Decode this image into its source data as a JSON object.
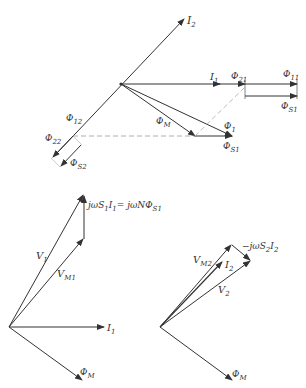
{
  "colors": {
    "line": "#333333",
    "dashed": "#999999",
    "background": "#ffffff"
  },
  "top_diagram": {
    "labels": {
      "I2": "I",
      "I2_sub": "2",
      "I1": "I",
      "I1_sub": "1",
      "phi21": "Φ",
      "phi21_sub": "21",
      "phi11": "Φ",
      "phi11_sub": "11",
      "phiS1_right": "Φ",
      "phiS1_right_sub": "S1",
      "phiM": "Φ",
      "phiM_sub": "M",
      "phi1": "Φ",
      "phi1_sub": "1",
      "phiS1": "Φ",
      "phiS1_sub": "S1",
      "phi12": "Φ",
      "phi12_sub": "12",
      "phi22": "Φ",
      "phi22_sub": "22",
      "phiS2": "Φ",
      "phiS2_sub": "S2"
    }
  },
  "bottom_left_diagram": {
    "labels": {
      "drop_eq_a": "jωS",
      "drop_eq_a_sub": "1",
      "drop_eq_b": "I",
      "drop_eq_b_sub": "1",
      "drop_eq_c": "= jωNΦ",
      "drop_eq_c_sub": "S1",
      "V1": "V",
      "V1_sub": "1",
      "VM1": "V",
      "VM1_sub": "M1",
      "I1": "I",
      "I1_sub": "1",
      "phiM": "Φ",
      "phiM_sub": "M"
    }
  },
  "bottom_right_diagram": {
    "labels": {
      "drop_eq_a": "−jωS",
      "drop_eq_a_sub": "2",
      "drop_eq_b": "I",
      "drop_eq_b_sub": "2",
      "VM2": "V",
      "VM2_sub": "M2",
      "I2": "I",
      "I2_sub": "2",
      "V2": "V",
      "V2_sub": "2",
      "phiM": "Φ",
      "phiM_sub": "M"
    }
  }
}
